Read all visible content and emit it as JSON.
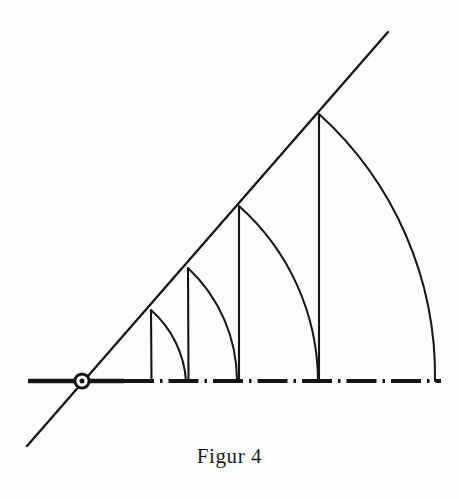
{
  "figure": {
    "caption": "Figur 4",
    "title": "Figur 4",
    "kind": "geometric-construction",
    "colors": {
      "ink": "#151515",
      "background": "#fdfdfc",
      "caption": "#1a1a1a"
    },
    "canvas": {
      "width": 459,
      "height": 499
    },
    "origin": {
      "label": "O",
      "x": 82,
      "y": 381
    },
    "baseline": {
      "name": "horizontal-axis",
      "y": 381,
      "x_start": 28,
      "x_end": 441,
      "solid_until": 120,
      "style": "chain-dash-dot",
      "stroke_width": 4.2
    },
    "ray": {
      "name": "inclined-ray",
      "x1": 27,
      "y1": 446,
      "x2": 388,
      "y2": 32,
      "angle_deg": 45.9,
      "stroke_width": 2.2
    },
    "origin_marker": {
      "outer_radius": 8.5,
      "ring_radius": 5.8,
      "dot_radius": 2.4
    },
    "vertices": [
      {
        "index": 1,
        "x": 151,
        "y": 310
      },
      {
        "index": 2,
        "x": 188,
        "y": 268
      },
      {
        "index": 3,
        "x": 239,
        "y": 206
      },
      {
        "index": 4,
        "x": 319,
        "y": 114
      }
    ],
    "verticals": [
      {
        "index": 1,
        "x": 151,
        "y_top": 310,
        "y_bottom": 381,
        "height": 71
      },
      {
        "index": 2,
        "x": 188,
        "y_top": 268,
        "y_bottom": 381,
        "height": 113
      },
      {
        "index": 3,
        "x": 239,
        "y_top": 206,
        "y_bottom": 381,
        "height": 175
      },
      {
        "index": 4,
        "x": 319,
        "y_top": 114,
        "y_bottom": 381,
        "height": 267
      }
    ],
    "arcs": [
      {
        "index": 1,
        "radius": 104,
        "from_x": 151,
        "from_y": 310,
        "to_x": 186,
        "to_y": 381
      },
      {
        "index": 2,
        "radius": 155,
        "from_x": 188,
        "from_y": 268,
        "to_x": 237,
        "to_y": 381
      },
      {
        "index": 3,
        "radius": 236,
        "from_x": 239,
        "from_y": 206,
        "to_x": 318,
        "to_y": 381
      },
      {
        "index": 4,
        "radius": 353,
        "from_x": 319,
        "from_y": 114,
        "to_x": 435,
        "to_y": 381
      }
    ],
    "axis_tick_points": [
      {
        "x": 122
      },
      {
        "x": 152
      },
      {
        "x": 186
      },
      {
        "x": 209
      },
      {
        "x": 237
      },
      {
        "x": 265
      },
      {
        "x": 318
      },
      {
        "x": 356
      },
      {
        "x": 435
      }
    ]
  }
}
